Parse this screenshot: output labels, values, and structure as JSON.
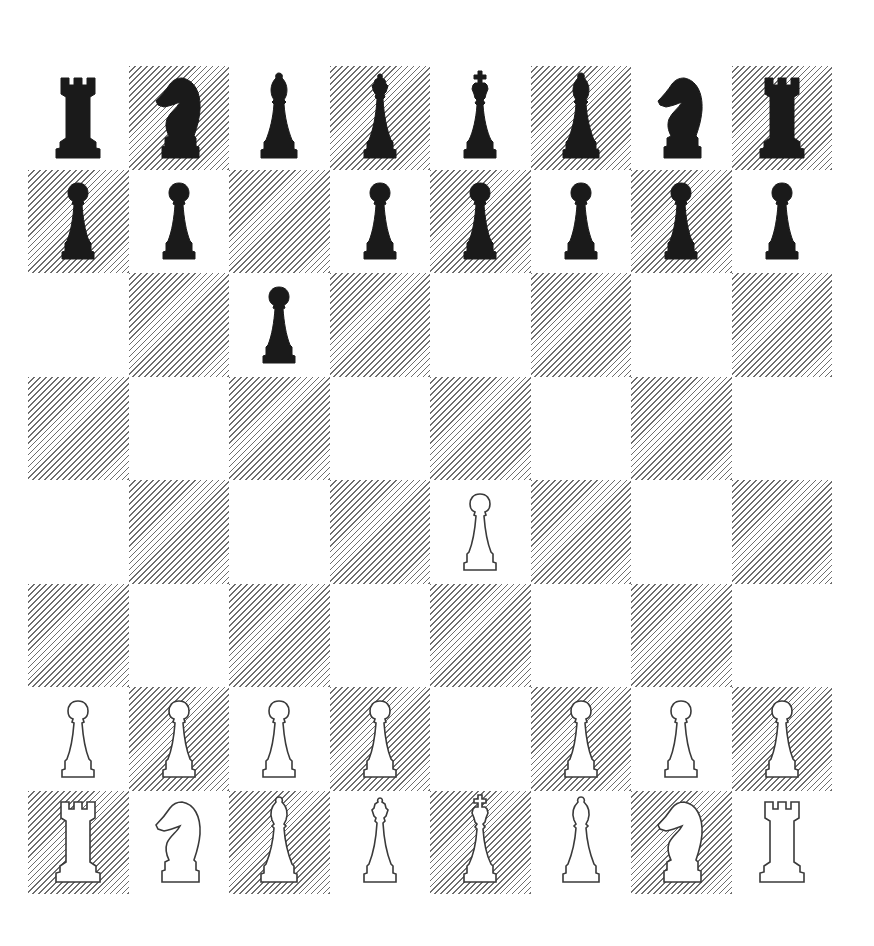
{
  "board": {
    "orientation": "white-bottom",
    "files": [
      "a",
      "b",
      "c",
      "d",
      "e",
      "f",
      "g",
      "h"
    ],
    "ranks": [
      "8",
      "7",
      "6",
      "5",
      "4",
      "3",
      "2",
      "1"
    ],
    "colors": {
      "light_square": "#ffffff",
      "dark_square_hatch": "#6e6e6e",
      "black_piece": "#1a1a1a",
      "white_piece_outline": "#3a3a3a"
    },
    "rows": [
      [
        "r",
        "n",
        "b",
        "q",
        "k",
        "b",
        "n",
        "r"
      ],
      [
        "p",
        "p",
        "",
        "p",
        "p",
        "p",
        "p",
        "p"
      ],
      [
        "",
        "",
        "p",
        "",
        "",
        "",
        "",
        ""
      ],
      [
        "",
        "",
        "",
        "",
        "",
        "",
        "",
        ""
      ],
      [
        "",
        "",
        "",
        "",
        "P",
        "",
        "",
        ""
      ],
      [
        "",
        "",
        "",
        "",
        "",
        "",
        "",
        ""
      ],
      [
        "P",
        "P",
        "P",
        "P",
        "",
        "P",
        "P",
        "P"
      ],
      [
        "R",
        "N",
        "B",
        "Q",
        "K",
        "B",
        "N",
        "R"
      ]
    ],
    "piece_names": {
      "k": "black king",
      "q": "black queen",
      "r": "black rook",
      "b": "black bishop",
      "n": "black knight",
      "p": "black pawn",
      "K": "white king",
      "Q": "white queen",
      "R": "white rook",
      "B": "white bishop",
      "N": "white knight",
      "P": "white pawn"
    },
    "fen": "rnbqkbnr/pp1ppppp/2p5/8/4P3/8/PPPP1PPP/RNBQKBNR b KQkq - 0 2"
  }
}
